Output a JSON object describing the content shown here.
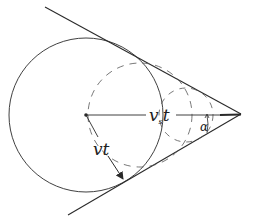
{
  "diagram": {
    "title": "",
    "labels": {
      "source_distance_main": "v",
      "source_distance_sub": "s",
      "source_distance_tail": "t",
      "wave_radius": "vt",
      "half_angle": "α"
    },
    "geometry": {
      "apex": [
        241,
        114
      ],
      "upper_line_start": [
        45,
        7
      ],
      "lower_line_start": [
        68,
        215
      ],
      "solid_circle": {
        "cx": 86,
        "cy": 115,
        "r": 78
      },
      "dashed_circle_large": {
        "cx": 140,
        "cy": 115,
        "r": 55
      },
      "dashed_circle_small": {
        "cx": 185,
        "cy": 115,
        "r": 28
      }
    },
    "colors": {
      "ink": "#2a2a2a",
      "background": "#ffffff"
    }
  }
}
